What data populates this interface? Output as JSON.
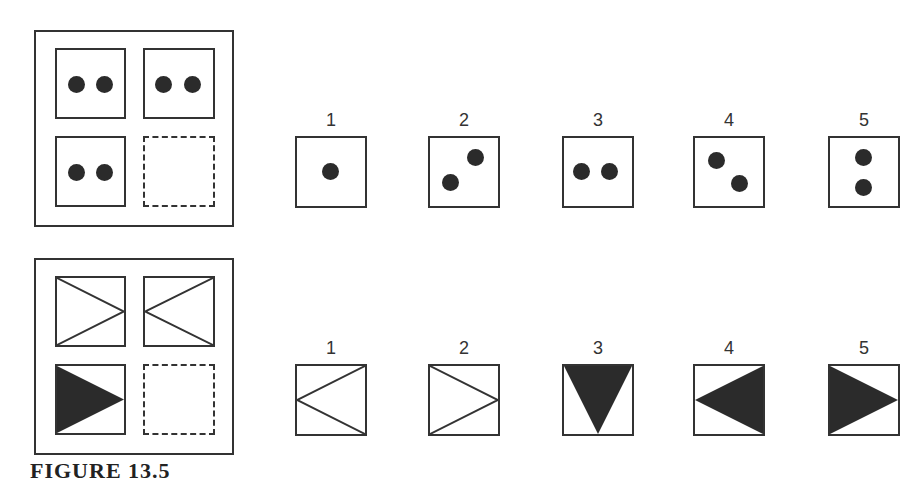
{
  "problem_1": {
    "matrix": {
      "cells": [
        {
          "position": "top-left",
          "content": "two-dots-horizontal"
        },
        {
          "position": "top-right",
          "content": "two-dots-horizontal"
        },
        {
          "position": "bottom-left",
          "content": "two-dots-horizontal"
        },
        {
          "position": "bottom-right",
          "content": "missing (dashed)"
        }
      ]
    },
    "options": [
      {
        "label": "1",
        "content": "one-dot-center"
      },
      {
        "label": "2",
        "content": "two-dots-diagonal-up"
      },
      {
        "label": "3",
        "content": "two-dots-horizontal"
      },
      {
        "label": "4",
        "content": "two-dots-diagonal-down"
      },
      {
        "label": "5",
        "content": "two-dots-vertical"
      }
    ]
  },
  "problem_2": {
    "matrix": {
      "cells": [
        {
          "position": "top-left",
          "content": "outline-triangle-pointing-right"
        },
        {
          "position": "top-right",
          "content": "outline-triangle-pointing-left"
        },
        {
          "position": "bottom-left",
          "content": "filled-triangle-pointing-right"
        },
        {
          "position": "bottom-right",
          "content": "missing (dashed)"
        }
      ]
    },
    "options": [
      {
        "label": "1",
        "content": "outline-triangle-pointing-left"
      },
      {
        "label": "2",
        "content": "outline-triangle-pointing-right"
      },
      {
        "label": "3",
        "content": "filled-triangle-pointing-down"
      },
      {
        "label": "4",
        "content": "filled-triangle-pointing-left"
      },
      {
        "label": "5",
        "content": "filled-triangle-pointing-right"
      }
    ]
  },
  "caption": "FIGURE 13.5",
  "colors": {
    "ink": "#2b2b2b",
    "background": "#ffffff"
  }
}
